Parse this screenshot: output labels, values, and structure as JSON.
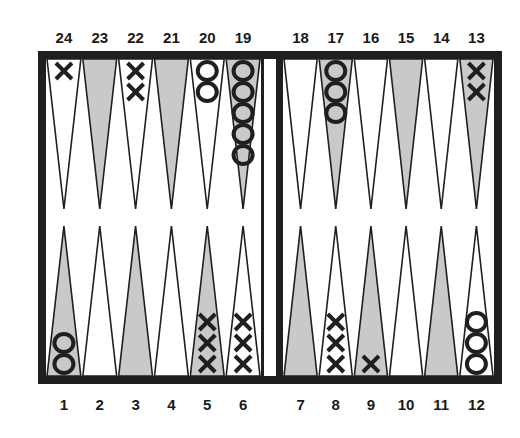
{
  "board": {
    "frame_color": "#1f1f1f",
    "background_color": "#ffffff",
    "shaded_point_color": "#c9c9c9",
    "line_color": "#1f1f1f",
    "checker_color": "#1f1f1f",
    "top_labels": [
      "24",
      "23",
      "22",
      "21",
      "20",
      "19",
      "18",
      "17",
      "16",
      "15",
      "14",
      "13"
    ],
    "bottom_labels": [
      "1",
      "2",
      "3",
      "4",
      "5",
      "6",
      "7",
      "8",
      "9",
      "10",
      "11",
      "12"
    ],
    "points": [
      {
        "number": 1,
        "shaded": true,
        "checker": "O",
        "count": 2
      },
      {
        "number": 2,
        "shaded": false,
        "checker": "",
        "count": 0
      },
      {
        "number": 3,
        "shaded": true,
        "checker": "",
        "count": 0
      },
      {
        "number": 4,
        "shaded": false,
        "checker": "",
        "count": 0
      },
      {
        "number": 5,
        "shaded": true,
        "checker": "X",
        "count": 3
      },
      {
        "number": 6,
        "shaded": false,
        "checker": "X",
        "count": 3
      },
      {
        "number": 7,
        "shaded": true,
        "checker": "",
        "count": 0
      },
      {
        "number": 8,
        "shaded": false,
        "checker": "X",
        "count": 3
      },
      {
        "number": 9,
        "shaded": true,
        "checker": "X",
        "count": 1
      },
      {
        "number": 10,
        "shaded": false,
        "checker": "",
        "count": 0
      },
      {
        "number": 11,
        "shaded": true,
        "checker": "",
        "count": 0
      },
      {
        "number": 12,
        "shaded": false,
        "checker": "O",
        "count": 3
      },
      {
        "number": 13,
        "shaded": true,
        "checker": "X",
        "count": 2
      },
      {
        "number": 14,
        "shaded": false,
        "checker": "",
        "count": 0
      },
      {
        "number": 15,
        "shaded": true,
        "checker": "",
        "count": 0
      },
      {
        "number": 16,
        "shaded": false,
        "checker": "",
        "count": 0
      },
      {
        "number": 17,
        "shaded": true,
        "checker": "O",
        "count": 3
      },
      {
        "number": 18,
        "shaded": false,
        "checker": "",
        "count": 0
      },
      {
        "number": 19,
        "shaded": true,
        "checker": "O",
        "count": 5
      },
      {
        "number": 20,
        "shaded": false,
        "checker": "O",
        "count": 2
      },
      {
        "number": 21,
        "shaded": true,
        "checker": "",
        "count": 0
      },
      {
        "number": 22,
        "shaded": false,
        "checker": "X",
        "count": 2
      },
      {
        "number": 23,
        "shaded": true,
        "checker": "",
        "count": 0
      },
      {
        "number": 24,
        "shaded": false,
        "checker": "X",
        "count": 1
      }
    ]
  }
}
